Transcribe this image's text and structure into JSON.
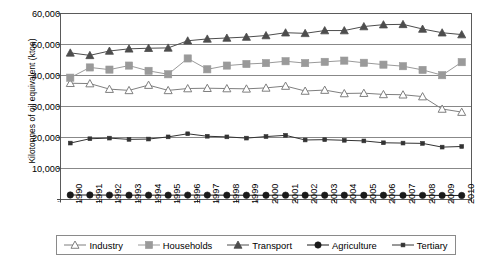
{
  "chart_data": {
    "type": "line",
    "title": "",
    "xlabel": "",
    "ylabel": "Kilotonnes of oil equivalent (ktoe)",
    "ylim": [
      0,
      60000
    ],
    "yticks": [
      0,
      10000,
      20000,
      30000,
      40000,
      50000,
      60000
    ],
    "ytick_labels": [
      "-",
      "10,000",
      "20,000",
      "30,000",
      "40,000",
      "50,000",
      "60,000"
    ],
    "grid": true,
    "legend_position": "bottom",
    "categories": [
      "1990",
      "1991",
      "1992",
      "1993",
      "1994",
      "1995",
      "1996",
      "1997",
      "1998",
      "1999",
      "2000",
      "2001",
      "2002",
      "2003",
      "2004",
      "2005",
      "2006",
      "2007",
      "2008",
      "2009",
      "2010"
    ],
    "series": [
      {
        "name": "Industry",
        "marker": "open-triangle",
        "color": "#7f7f7f",
        "values": [
          37500,
          37400,
          35600,
          35200,
          36900,
          35200,
          35800,
          35900,
          35800,
          35700,
          36000,
          36600,
          35000,
          35300,
          34200,
          34300,
          33900,
          33800,
          33200,
          29200,
          28200
        ]
      },
      {
        "name": "Households",
        "marker": "filled-square",
        "color": "#9a9a9a",
        "values": [
          39300,
          42600,
          41900,
          43200,
          41500,
          40400,
          45500,
          42000,
          43200,
          43700,
          44000,
          44600,
          44000,
          44400,
          44800,
          44100,
          43500,
          43000,
          41800,
          40100,
          44300
        ]
      },
      {
        "name": "Transport",
        "marker": "filled-triangle",
        "color": "#4d4d4d",
        "values": [
          47300,
          46500,
          47900,
          48600,
          48800,
          48900,
          51200,
          51800,
          52100,
          52400,
          52900,
          53800,
          53600,
          54500,
          54500,
          55800,
          56400,
          56500,
          55000,
          53800,
          53200
        ]
      },
      {
        "name": "Agriculture",
        "marker": "filled-circle",
        "color": "#1a1a1a",
        "values": [
          1450,
          1450,
          1420,
          1400,
          1400,
          1400,
          1420,
          1420,
          1400,
          1380,
          1380,
          1400,
          1380,
          1380,
          1380,
          1360,
          1360,
          1340,
          1340,
          1320,
          1300
        ]
      },
      {
        "name": "Tertiary",
        "marker": "small-square",
        "color": "#333333",
        "values": [
          18200,
          19600,
          19800,
          19400,
          19500,
          20200,
          21200,
          20400,
          20200,
          19800,
          20300,
          20700,
          19200,
          19300,
          19100,
          18900,
          18300,
          18200,
          18100,
          16900,
          17100
        ]
      }
    ]
  }
}
